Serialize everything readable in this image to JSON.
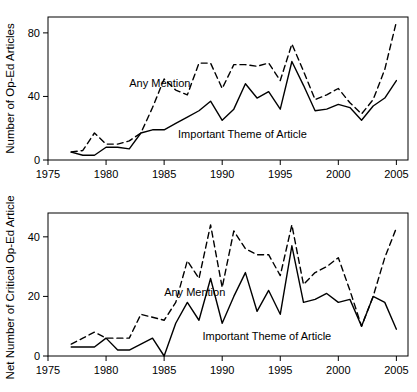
{
  "chart_data": [
    {
      "id": "op-ed-articles",
      "type": "line",
      "title": "",
      "xlabel": "",
      "ylabel": "Number of Op-Ed Articles",
      "xlim": [
        1975,
        2006
      ],
      "ylim": [
        0,
        90
      ],
      "xticks": [
        1975,
        1980,
        1985,
        1990,
        1995,
        2000,
        2005
      ],
      "yticks": [
        0,
        40,
        80
      ],
      "grid": false,
      "legend_position": "inline-annotation",
      "x": [
        1977,
        1978,
        1979,
        1980,
        1981,
        1982,
        1983,
        1984,
        1985,
        1986,
        1987,
        1988,
        1989,
        1990,
        1991,
        1992,
        1993,
        1994,
        1995,
        1996,
        1997,
        1998,
        1999,
        2000,
        2001,
        2002,
        2003,
        2004,
        2005
      ],
      "series": [
        {
          "name": "Any Mention",
          "style": "dashed",
          "values": [
            5,
            6,
            17,
            10,
            10,
            12,
            17,
            33,
            51,
            44,
            41,
            61,
            61,
            45,
            60,
            60,
            59,
            61,
            50,
            73,
            56,
            38,
            41,
            45,
            36,
            29,
            38,
            57,
            87
          ]
        },
        {
          "name": "Important Theme of Article",
          "style": "solid",
          "values": [
            5,
            3,
            3,
            8,
            8,
            7,
            17,
            19,
            19,
            23,
            27,
            31,
            37,
            25,
            32,
            48,
            39,
            43,
            32,
            62,
            47,
            31,
            32,
            35,
            33,
            25,
            34,
            39,
            50
          ]
        }
      ],
      "annotations": [
        {
          "text": "Any Mention",
          "x": 1982.0,
          "y": 46
        },
        {
          "text": "Important Theme of Article",
          "x": 1986.2,
          "y": 14
        }
      ]
    },
    {
      "id": "net-critical-op-ed-articles",
      "type": "line",
      "title": "",
      "xlabel": "",
      "ylabel": "Net Number of Critical Op-Ed Articles",
      "xlim": [
        1975,
        2006
      ],
      "ylim": [
        0,
        48
      ],
      "xticks": [
        1975,
        1980,
        1985,
        1990,
        1995,
        2000,
        2005
      ],
      "yticks": [
        0,
        20,
        40
      ],
      "grid": false,
      "legend_position": "inline-annotation",
      "x": [
        1977,
        1978,
        1979,
        1980,
        1981,
        1982,
        1983,
        1984,
        1985,
        1986,
        1987,
        1988,
        1989,
        1990,
        1991,
        1992,
        1993,
        1994,
        1995,
        1996,
        1997,
        1998,
        1999,
        2000,
        2001,
        2002,
        2003,
        2004,
        2005
      ],
      "series": [
        {
          "name": "Any Mention",
          "style": "dashed",
          "values": [
            4,
            6,
            8,
            6,
            6,
            6,
            14,
            13,
            12,
            18,
            32,
            26,
            44,
            23,
            42,
            36,
            34,
            34,
            27,
            44,
            24,
            28,
            30,
            33,
            22,
            10,
            20,
            33,
            43
          ]
        },
        {
          "name": "Important Theme of Article",
          "style": "solid",
          "values": [
            3,
            3,
            3,
            6,
            2,
            2,
            4,
            6,
            0,
            11,
            18,
            12,
            26,
            11,
            20,
            28,
            15,
            22,
            14,
            37,
            18,
            19,
            21,
            18,
            19,
            10,
            20,
            18,
            9
          ]
        }
      ],
      "annotations": [
        {
          "text": "Any Mention",
          "x": 1985.0,
          "y": 20
        },
        {
          "text": "Important Theme of Article",
          "x": 1988.3,
          "y": 5.5
        }
      ]
    }
  ]
}
